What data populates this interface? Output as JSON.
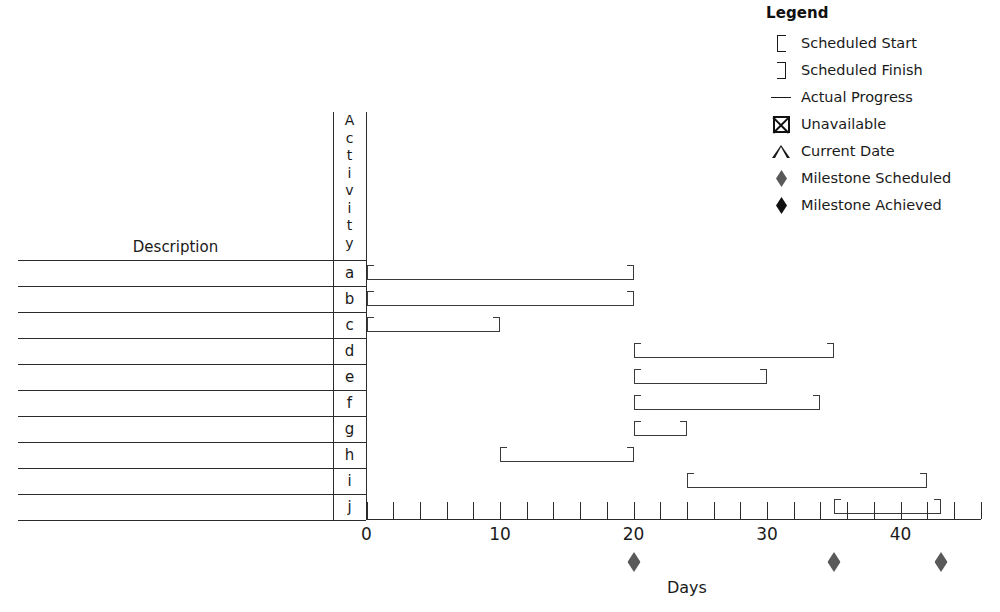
{
  "legend": {
    "title": "Legend",
    "items": [
      {
        "icon": "bracket-left-icon",
        "label": "Scheduled Start"
      },
      {
        "icon": "bracket-right-icon",
        "label": "Scheduled Finish"
      },
      {
        "icon": "horizontal-line-icon",
        "label": "Actual Progress"
      },
      {
        "icon": "crossed-box-icon",
        "label": "Unavailable"
      },
      {
        "icon": "caret-up-icon",
        "label": "Current Date"
      },
      {
        "icon": "gray-diamond-icon",
        "label": "Milestone Scheduled"
      },
      {
        "icon": "black-diamond-icon",
        "label": "Milestone Achieved"
      }
    ]
  },
  "table": {
    "description_header": "Description",
    "activity_header": "Activity",
    "activity_header_letters": [
      "A",
      "c",
      "t",
      "i",
      "v",
      "i",
      "t",
      "y"
    ],
    "activity_ids": [
      "a",
      "b",
      "c",
      "d",
      "e",
      "f",
      "g",
      "h",
      "i",
      "j"
    ],
    "descriptions": [
      "",
      "",
      "",
      "",
      "",
      "",
      "",
      "",
      "",
      ""
    ]
  },
  "colors": {
    "bar_stroke": "#3a3a3a",
    "grid": "#2b2b2b",
    "milestone_scheduled": "#595959",
    "milestone_achieved": "#111111",
    "background": "#ffffff"
  },
  "chart_data": {
    "type": "bar",
    "title": "",
    "xlabel": "Days",
    "ylabel": "Activity",
    "xlim": [
      0,
      46
    ],
    "x_ticks_major": [
      0,
      10,
      20,
      30,
      40
    ],
    "x_tick_labels": [
      "0",
      "10",
      "20",
      "30",
      "40"
    ],
    "x_tick_interval_minor": 2,
    "grid": false,
    "legend_position": "top-right",
    "categories": [
      "a",
      "b",
      "c",
      "d",
      "e",
      "f",
      "g",
      "h",
      "i",
      "j"
    ],
    "series": [
      {
        "name": "Scheduled Span",
        "bars": [
          {
            "activity": "a",
            "start": 0,
            "finish": 20,
            "progress_to": 20
          },
          {
            "activity": "b",
            "start": 0,
            "finish": 20,
            "progress_to": 20
          },
          {
            "activity": "c",
            "start": 0,
            "finish": 10,
            "progress_to": 10
          },
          {
            "activity": "d",
            "start": 20,
            "finish": 35,
            "progress_to": 35
          },
          {
            "activity": "e",
            "start": 20,
            "finish": 30,
            "progress_to": 30
          },
          {
            "activity": "f",
            "start": 20,
            "finish": 34,
            "progress_to": 34
          },
          {
            "activity": "g",
            "start": 20,
            "finish": 24,
            "progress_to": 24
          },
          {
            "activity": "h",
            "start": 10,
            "finish": 20,
            "progress_to": 20
          },
          {
            "activity": "i",
            "start": 24,
            "finish": 42,
            "progress_to": 42
          },
          {
            "activity": "j",
            "start": 35,
            "finish": 43,
            "progress_to": 43
          }
        ]
      }
    ],
    "milestones": [
      {
        "day": 20,
        "type": "Milestone Scheduled",
        "achieved": false
      },
      {
        "day": 35,
        "type": "Milestone Scheduled",
        "achieved": false
      },
      {
        "day": 43,
        "type": "Milestone Scheduled",
        "achieved": false
      }
    ]
  }
}
